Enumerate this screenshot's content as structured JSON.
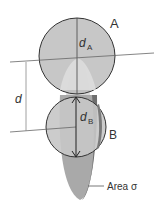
{
  "diagram": {
    "labels": {
      "circle_a": "A",
      "circle_b": "B",
      "diameter_a": "d",
      "diameter_a_sub": "A",
      "diameter_b": "d",
      "diameter_b_sub": "B",
      "separation": "d",
      "area": "Area σ"
    },
    "colors": {
      "circle_fill": "#b9b9b9",
      "circle_stroke": "#333333",
      "ellipse_fill": "#a8a8a8",
      "ellipse_highlight": "#d8d8d8",
      "ellipse_shadow": "#6e6e6e",
      "line": "#555555"
    }
  }
}
